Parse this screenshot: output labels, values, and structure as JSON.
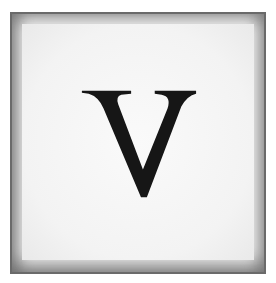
{
  "tile": {
    "letter": "V",
    "letter_color": "#161616",
    "background_color": "#f6f6f6",
    "border_color": "#6a6a6a"
  }
}
